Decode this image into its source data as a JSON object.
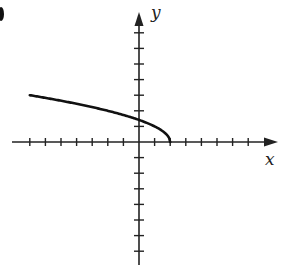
{
  "chart_data": {
    "type": "line",
    "title": "",
    "xlabel": "x",
    "ylabel": "y",
    "xlim": [
      -8,
      9
    ],
    "ylim": [
      -8,
      8
    ],
    "tick_spacing": 1,
    "grid": false,
    "function": "y = sqrt(2 - x)",
    "series": [
      {
        "name": "curve",
        "x": [
          -7,
          -6,
          -5,
          -4,
          -3,
          -2,
          -1,
          0,
          1,
          1.5,
          2
        ],
        "y": [
          3,
          2.83,
          2.65,
          2.45,
          2.24,
          2,
          1.73,
          1.41,
          1,
          0.71,
          0
        ]
      }
    ],
    "colors": {
      "axis": "#222222",
      "curve": "#111111"
    }
  },
  "labels": {
    "x_axis": "x",
    "y_axis": "y"
  }
}
